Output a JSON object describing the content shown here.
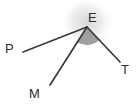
{
  "figure": {
    "type": "angle-diagram",
    "background_color": "#ffffff",
    "ray_color": "#3a3a3a",
    "label_color": "#2e2e2e",
    "shaded_sector_color": "#9a9a9a",
    "glow_color": "#d8d8d8",
    "vertex": {
      "name": "E",
      "label": "E",
      "x": 87,
      "y": 27,
      "label_x": 88,
      "label_y": 22
    },
    "rays": [
      {
        "name": "ray-EP",
        "label": "P",
        "endpoint_x": 23,
        "endpoint_y": 52,
        "label_x": 5,
        "label_y": 53
      },
      {
        "name": "ray-EM",
        "label": "M",
        "endpoint_x": 50,
        "endpoint_y": 85,
        "label_x": 29,
        "label_y": 98
      },
      {
        "name": "ray-ET",
        "label": "T",
        "endpoint_x": 120,
        "endpoint_y": 62,
        "label_x": 121,
        "label_y": 74
      }
    ],
    "shaded_angle": {
      "name": "angle-MET",
      "from_ray": "ray-EM",
      "to_ray": "ray-ET",
      "radius": 18
    }
  }
}
